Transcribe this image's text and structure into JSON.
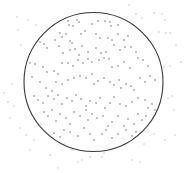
{
  "figure": {
    "width": 193,
    "height": 173,
    "background": "#ffffff",
    "circle": {
      "cx": 93.5,
      "cy": 82,
      "r": 69.5,
      "stroke": "#3a3a3a",
      "stroke_width": 1.1
    },
    "inside_color": "#555555",
    "outside_color": "#b8b8b8",
    "points_inside": [
      [
        68,
        21
      ],
      [
        69,
        25
      ],
      [
        73,
        26
      ],
      [
        77,
        20
      ],
      [
        79,
        22
      ],
      [
        92,
        24
      ],
      [
        98,
        21
      ],
      [
        105,
        21
      ],
      [
        110,
        22
      ],
      [
        111,
        26
      ],
      [
        118,
        25
      ],
      [
        60,
        33
      ],
      [
        62,
        37
      ],
      [
        66,
        34
      ],
      [
        70,
        41
      ],
      [
        72,
        43
      ],
      [
        81,
        34
      ],
      [
        85,
        31
      ],
      [
        96,
        34
      ],
      [
        100,
        38
      ],
      [
        108,
        38
      ],
      [
        112,
        40
      ],
      [
        118,
        34
      ],
      [
        124,
        40
      ],
      [
        128,
        36
      ],
      [
        40,
        42
      ],
      [
        44,
        44
      ],
      [
        47,
        48
      ],
      [
        55,
        40
      ],
      [
        59,
        46
      ],
      [
        63,
        53
      ],
      [
        70,
        50
      ],
      [
        75,
        49
      ],
      [
        79,
        55
      ],
      [
        82,
        46
      ],
      [
        88,
        52
      ],
      [
        96,
        48
      ],
      [
        101,
        53
      ],
      [
        106,
        52
      ],
      [
        114,
        45
      ],
      [
        120,
        50
      ],
      [
        125,
        47
      ],
      [
        131,
        47
      ],
      [
        136,
        52
      ],
      [
        30,
        63
      ],
      [
        35,
        64
      ],
      [
        43,
        67
      ],
      [
        47,
        72
      ],
      [
        54,
        71
      ],
      [
        58,
        74
      ],
      [
        62,
        63
      ],
      [
        68,
        63
      ],
      [
        73,
        66
      ],
      [
        78,
        60
      ],
      [
        83,
        63
      ],
      [
        88,
        59
      ],
      [
        92,
        62
      ],
      [
        99,
        60
      ],
      [
        104,
        58
      ],
      [
        109,
        59
      ],
      [
        112,
        67
      ],
      [
        118,
        66
      ],
      [
        124,
        62
      ],
      [
        130,
        68
      ],
      [
        138,
        58
      ],
      [
        143,
        60
      ],
      [
        148,
        66
      ],
      [
        32,
        77
      ],
      [
        40,
        82
      ],
      [
        46,
        88
      ],
      [
        52,
        91
      ],
      [
        56,
        82
      ],
      [
        62,
        84
      ],
      [
        68,
        80
      ],
      [
        74,
        78
      ],
      [
        80,
        76
      ],
      [
        86,
        78
      ],
      [
        92,
        74
      ],
      [
        94,
        84
      ],
      [
        98,
        81
      ],
      [
        104,
        78
      ],
      [
        110,
        82
      ],
      [
        114,
        85
      ],
      [
        119,
        80
      ],
      [
        121,
        88
      ],
      [
        126,
        84
      ],
      [
        131,
        86
      ],
      [
        134,
        90
      ],
      [
        140,
        78
      ],
      [
        145,
        82
      ],
      [
        150,
        76
      ],
      [
        155,
        80
      ],
      [
        34,
        96
      ],
      [
        38,
        100
      ],
      [
        43,
        103
      ],
      [
        48,
        96
      ],
      [
        54,
        99
      ],
      [
        58,
        95
      ],
      [
        62,
        104
      ],
      [
        67,
        98
      ],
      [
        72,
        101
      ],
      [
        76,
        95
      ],
      [
        81,
        99
      ],
      [
        86,
        106
      ],
      [
        90,
        101
      ],
      [
        96,
        103
      ],
      [
        100,
        98
      ],
      [
        105,
        108
      ],
      [
        110,
        103
      ],
      [
        114,
        97
      ],
      [
        120,
        104
      ],
      [
        126,
        106
      ],
      [
        132,
        102
      ],
      [
        138,
        98
      ],
      [
        145,
        100
      ],
      [
        148,
        108
      ],
      [
        152,
        104
      ],
      [
        155,
        110
      ],
      [
        44,
        112
      ],
      [
        48,
        116
      ],
      [
        52,
        110
      ],
      [
        56,
        121
      ],
      [
        60,
        114
      ],
      [
        66,
        118
      ],
      [
        70,
        124
      ],
      [
        74,
        112
      ],
      [
        80,
        116
      ],
      [
        86,
        110
      ],
      [
        88,
        120
      ],
      [
        92,
        114
      ],
      [
        97,
        118
      ],
      [
        103,
        116
      ],
      [
        108,
        126
      ],
      [
        112,
        122
      ],
      [
        118,
        116
      ],
      [
        124,
        126
      ],
      [
        128,
        119
      ],
      [
        134,
        124
      ],
      [
        138,
        114
      ],
      [
        142,
        120
      ],
      [
        146,
        116
      ],
      [
        54,
        133
      ],
      [
        60,
        137
      ],
      [
        64,
        130
      ],
      [
        70,
        132
      ],
      [
        78,
        136
      ],
      [
        84,
        128
      ],
      [
        90,
        134
      ],
      [
        94,
        140
      ],
      [
        102,
        134
      ],
      [
        106,
        130
      ],
      [
        112,
        138
      ],
      [
        118,
        134
      ],
      [
        126,
        130
      ],
      [
        132,
        136
      ],
      [
        136,
        132
      ]
    ],
    "points_outside": [
      [
        17,
        17
      ],
      [
        18,
        30
      ],
      [
        21,
        45
      ],
      [
        28,
        20
      ],
      [
        36,
        25
      ],
      [
        129,
        5
      ],
      [
        136,
        14
      ],
      [
        142,
        18
      ],
      [
        154,
        13
      ],
      [
        162,
        14
      ],
      [
        165,
        20
      ],
      [
        159,
        32
      ],
      [
        166,
        33
      ],
      [
        170,
        33
      ],
      [
        176,
        45
      ],
      [
        181,
        62
      ],
      [
        170,
        66
      ],
      [
        164,
        67
      ],
      [
        168,
        98
      ],
      [
        172,
        96
      ],
      [
        174,
        110
      ],
      [
        175,
        135
      ],
      [
        165,
        140
      ],
      [
        154,
        134
      ],
      [
        144,
        144
      ],
      [
        132,
        160
      ],
      [
        104,
        153
      ],
      [
        102,
        157
      ],
      [
        90,
        157
      ],
      [
        82,
        160
      ],
      [
        78,
        162
      ],
      [
        72,
        150
      ],
      [
        64,
        144
      ],
      [
        14,
        106
      ],
      [
        10,
        118
      ],
      [
        8,
        102
      ],
      [
        12,
        84
      ],
      [
        4,
        93
      ],
      [
        20,
        128
      ],
      [
        26,
        135
      ],
      [
        34,
        140
      ],
      [
        30,
        150
      ],
      [
        50,
        155
      ],
      [
        140,
        162
      ],
      [
        58,
        168
      ]
    ]
  }
}
